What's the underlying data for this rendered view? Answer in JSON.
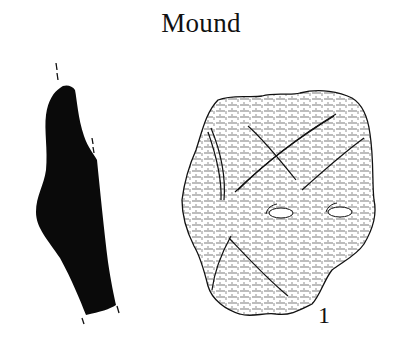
{
  "figure": {
    "title": "Mound",
    "number": "1",
    "items": [
      {
        "name": "section-profile",
        "description": "Black filled cross-section of sherd with dashed orientation marks"
      },
      {
        "name": "sherd-exterior",
        "description": "Stippled/hatched drawing of pottery sherd exterior with incised lines and two oval impressions"
      }
    ],
    "colors": {
      "ink": "#111111",
      "background": "#ffffff"
    }
  }
}
